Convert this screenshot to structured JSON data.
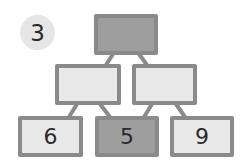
{
  "problem_number": "3",
  "colors": {
    "border": "#8a8a8a",
    "dark_fill": "#9e9e9e",
    "light_fill": "#e8e8e8",
    "badge": "#e6e6e6"
  },
  "pyramid": {
    "top": {
      "value": "",
      "shaded": true
    },
    "middle": [
      {
        "value": "",
        "shaded": false
      },
      {
        "value": "",
        "shaded": false
      }
    ],
    "bottom": [
      {
        "value": "6",
        "shaded": false
      },
      {
        "value": "5",
        "shaded": true
      },
      {
        "value": "9",
        "shaded": false
      }
    ]
  }
}
